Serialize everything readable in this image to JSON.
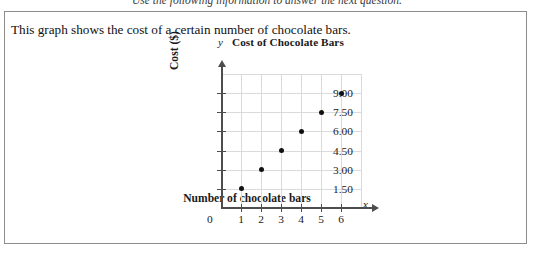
{
  "instruction": "Use the following information to answer the next question.",
  "question": {
    "stem": "This graph shows the cost of a certain number of chocolate bars."
  },
  "chart_data": {
    "type": "scatter",
    "title": "Cost of Chocolate Bars",
    "xlabel": "Number of chocolate bars",
    "ylabel": "Cost ($)",
    "x_axis_variable": "x",
    "y_axis_variable": "y",
    "origin_label": "0",
    "grid": true,
    "legend": "none",
    "xlim": [
      0,
      7
    ],
    "ylim": [
      0,
      10.5
    ],
    "x_ticks": [
      1,
      2,
      3,
      4,
      5,
      6
    ],
    "x_tick_labels": [
      "1",
      "2",
      "3",
      "4",
      "5",
      "6"
    ],
    "y_ticks": [
      1.5,
      3.0,
      4.5,
      6.0,
      7.5,
      9.0
    ],
    "y_tick_labels": [
      "1.50",
      "3.00",
      "4.50",
      "6.00",
      "7.50",
      "9.00"
    ],
    "x": [
      1,
      2,
      3,
      4,
      5,
      6
    ],
    "values": [
      1.5,
      3.0,
      4.5,
      6.0,
      7.5,
      9.0
    ],
    "points": [
      {
        "x": 1,
        "y": 1.5
      },
      {
        "x": 2,
        "y": 3.0
      },
      {
        "x": 3,
        "y": 4.5
      },
      {
        "x": 4,
        "y": 6.0
      },
      {
        "x": 5,
        "y": 7.5
      },
      {
        "x": 6,
        "y": 9.0
      }
    ],
    "point_color": "#111111",
    "grid_color": "#dadada",
    "axis_color": "#4d4d4d"
  }
}
